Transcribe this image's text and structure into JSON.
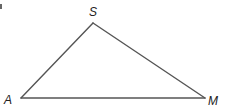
{
  "diagram": {
    "type": "triangle",
    "vertices": [
      {
        "id": "S",
        "label": "S"
      },
      {
        "id": "A",
        "label": "A"
      },
      {
        "id": "M",
        "label": "M"
      }
    ],
    "edges": [
      {
        "from": "A",
        "to": "S"
      },
      {
        "from": "S",
        "to": "M"
      },
      {
        "from": "A",
        "to": "M"
      }
    ],
    "colors": {
      "stroke": "#555555",
      "label": "#222222",
      "background": "#ffffff"
    }
  }
}
